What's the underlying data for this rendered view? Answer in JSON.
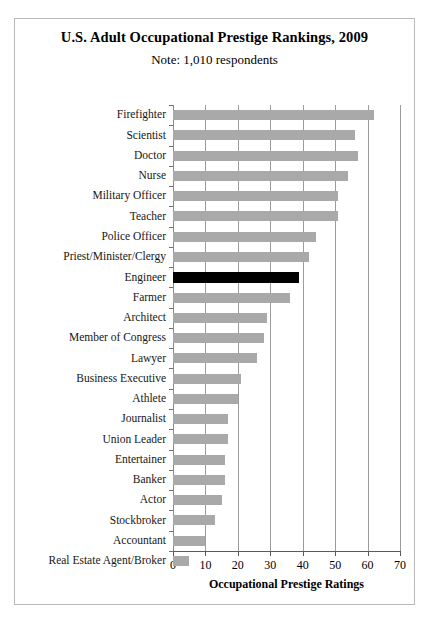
{
  "chart_data": {
    "type": "bar",
    "orientation": "horizontal",
    "title": "U.S. Adult Occupational Prestige Rankings, 2009",
    "subtitle": "Note: 1,010 respondents",
    "xlabel": "Occupational Prestige Ratings",
    "ylabel": "",
    "xlim": [
      0,
      70
    ],
    "xticks": [
      0,
      10,
      20,
      30,
      40,
      50,
      60,
      70
    ],
    "grid": "vertical",
    "legend": "none",
    "highlight_category": "Engineer",
    "highlight_color": "#000000",
    "bar_color": "#a9a9a9",
    "categories": [
      "Firefighter",
      "Scientist",
      "Doctor",
      "Nurse",
      "Military Officer",
      "Teacher",
      "Police Officer",
      "Priest/Minister/Clergy",
      "Engineer",
      "Farmer",
      "Architect",
      "Member of Congress",
      "Lawyer",
      "Business Executive",
      "Athlete",
      "Journalist",
      "Union Leader",
      "Entertainer",
      "Banker",
      "Actor",
      "Stockbroker",
      "Accountant",
      "Real Estate Agent/Broker"
    ],
    "values": [
      62,
      56,
      57,
      54,
      51,
      51,
      44,
      42,
      39,
      36,
      29,
      28,
      26,
      21,
      20,
      17,
      17,
      16,
      16,
      15,
      13,
      10,
      5
    ]
  }
}
